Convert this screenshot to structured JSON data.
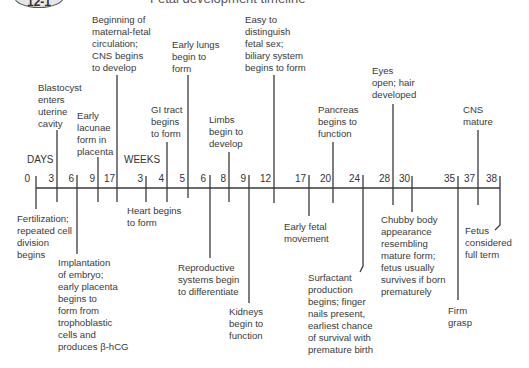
{
  "header": {
    "badge": "12-1",
    "title": "Fetal development timeline"
  },
  "axis": {
    "days_label": "DAYS",
    "weeks_label": "WEEKS",
    "days_ticks": [
      "0",
      "3",
      "6",
      "9",
      "17"
    ],
    "weeks_ticks": [
      "3",
      "4",
      "5",
      "6",
      "8",
      "9",
      "12",
      "17",
      "20",
      "24",
      "28",
      "30",
      "35",
      "37",
      "38"
    ]
  },
  "events_above": [
    {
      "id": "blastocyst",
      "time": "Day 3",
      "text": "Blastocyst\nenters\nuterine\ncavity"
    },
    {
      "id": "lacunae",
      "time": "Day 9",
      "text": "Early\nlacunae\nform in\nplacenta"
    },
    {
      "id": "maternal-fetal",
      "time": "Day 17",
      "text": "Beginning of\nmaternal-fetal\ncirculation;\nCNS begins\nto develop"
    },
    {
      "id": "gi-tract",
      "time": "Week 4",
      "text": "GI tract\nbegins\nto form"
    },
    {
      "id": "early-lungs",
      "time": "Week 5",
      "text": "Early lungs\nbegin to\nform"
    },
    {
      "id": "limbs",
      "time": "Week 8",
      "text": "Limbs\nbegin to\ndevelop"
    },
    {
      "id": "fetal-sex",
      "time": "Week 12",
      "text": "Easy to\ndistinguish\nfetal sex;\nbiliary system\nbegins to form"
    },
    {
      "id": "pancreas",
      "time": "Week 20",
      "text": "Pancreas\nbegins to\nfunction"
    },
    {
      "id": "eyes",
      "time": "Week 28",
      "text": "Eyes\nopen; hair\ndeveloped"
    },
    {
      "id": "cns-mature",
      "time": "Week 37",
      "text": "CNS\nmature"
    }
  ],
  "events_below": [
    {
      "id": "fertilization",
      "time": "Day 0",
      "text": "Fertilization;\nrepeated cell\ndivision\nbegins"
    },
    {
      "id": "implantation",
      "time": "Day 6",
      "text": "Implantation\nof embryo;\nearly placenta\nbegins to\nform from\ntrophoblastic\ncells and\nproduces β-hCG"
    },
    {
      "id": "heart",
      "time": "Week 3",
      "text": "Heart begins\nto form"
    },
    {
      "id": "reproductive",
      "time": "Week 6",
      "text": "Reproductive\nsystems begin\nto differentiate"
    },
    {
      "id": "kidneys",
      "time": "Week 9",
      "text": "Kidneys\nbegin to\nfunction"
    },
    {
      "id": "fetal-movement",
      "time": "Week 17",
      "text": "Early fetal\nmovement"
    },
    {
      "id": "surfactant",
      "time": "Week 24",
      "text": "Surfactant\nproduction\nbegins; finger\nnails present,\nearliest chance\nof survival with\npremature birth"
    },
    {
      "id": "chubby",
      "time": "Week 30",
      "text": "Chubby body\nappearance\nresembling\nmature form;\nfetus usually\nsurvives if born\nprematurely"
    },
    {
      "id": "firm-grasp",
      "time": "Week 35",
      "text": "Firm\ngrasp"
    },
    {
      "id": "full-term",
      "time": "Week 38",
      "text": "Fetus\nconsidered\nfull term"
    }
  ]
}
